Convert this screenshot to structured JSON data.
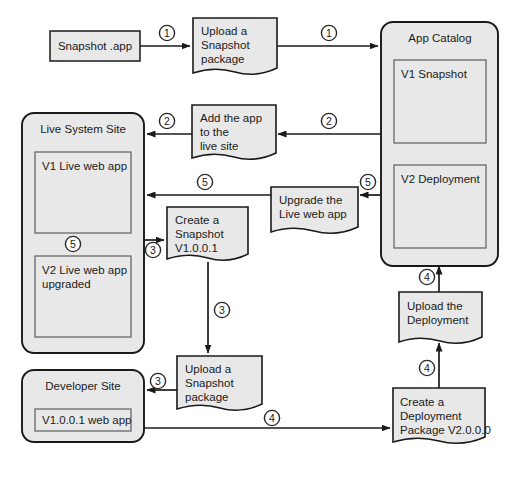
{
  "diagram": {
    "colors": {
      "shape_fill": "#e8e8e8",
      "shape_stroke": "#1a1a1a",
      "inner_stroke": "#5d5d5d",
      "connector": "#1a1a1a",
      "background": "#ffffff"
    },
    "containers": [
      {
        "id": "live-system-site",
        "title": "Live System Site",
        "children": [
          {
            "id": "v1-live-web-app",
            "label": "V1 Live web app"
          },
          {
            "id": "v2-live-web-app",
            "label": "V2 Live web app upgraded",
            "line1": "V2 Live web app",
            "line2": "upgraded"
          }
        ]
      },
      {
        "id": "app-catalog",
        "title": "App Catalog",
        "children": [
          {
            "id": "v1-snapshot",
            "label": "V1 Snapshot"
          },
          {
            "id": "v2-deployment",
            "label": "V2 Deployment"
          }
        ]
      },
      {
        "id": "developer-site",
        "title": "Developer Site",
        "children": [
          {
            "id": "v1001-web-app",
            "label": "V1.0.0.1 web app"
          }
        ]
      }
    ],
    "nodes": [
      {
        "id": "snapshot-app",
        "shape": "rectangle",
        "lines": [
          "Snapshot .app"
        ]
      },
      {
        "id": "upload-snapshot-package-top",
        "shape": "document",
        "lines": [
          "Upload a",
          "Snapshot",
          "package"
        ]
      },
      {
        "id": "add-app-to-live-site",
        "shape": "document",
        "lines": [
          "Add the app",
          "to the",
          "live site"
        ]
      },
      {
        "id": "create-snapshot-v1001",
        "shape": "document",
        "lines": [
          "Create a",
          "Snapshot",
          "V1.0.0.1"
        ]
      },
      {
        "id": "upgrade-live-web-app",
        "shape": "document",
        "lines": [
          "Upgrade the",
          "Live web app"
        ]
      },
      {
        "id": "upload-snapshot-package-bottom",
        "shape": "document",
        "lines": [
          "Upload a",
          "Snapshot",
          "package"
        ]
      },
      {
        "id": "upload-the-deployment",
        "shape": "document",
        "lines": [
          "Upload the",
          "Deployment"
        ]
      },
      {
        "id": "create-deployment-package-v2000",
        "shape": "document",
        "lines": [
          "Create a",
          "Deployment",
          "Package V2.0.0.0"
        ]
      }
    ],
    "step_badges": [
      {
        "id": "badge-1-a",
        "label": "①",
        "number": 1,
        "x": 167,
        "y": 33
      },
      {
        "id": "badge-1-b",
        "label": "①",
        "number": 1,
        "x": 329,
        "y": 33
      },
      {
        "id": "badge-2-a",
        "label": "②",
        "number": 2,
        "x": 167,
        "y": 121
      },
      {
        "id": "badge-2-b",
        "label": "②",
        "number": 2,
        "x": 329,
        "y": 121
      },
      {
        "id": "badge-5-a",
        "label": "⑤",
        "number": 5,
        "x": 205,
        "y": 182
      },
      {
        "id": "badge-5-b",
        "label": "⑤",
        "number": 5,
        "x": 368,
        "y": 182
      },
      {
        "id": "badge-5-c",
        "label": "⑤",
        "number": 5,
        "x": 73,
        "y": 244
      },
      {
        "id": "badge-3-a",
        "label": "③",
        "number": 3,
        "x": 153,
        "y": 250
      },
      {
        "id": "badge-3-b",
        "label": "③",
        "number": 3,
        "x": 222,
        "y": 310
      },
      {
        "id": "badge-3-c",
        "label": "③",
        "number": 3,
        "x": 158,
        "y": 381
      },
      {
        "id": "badge-4-a",
        "label": "④",
        "number": 4,
        "x": 427,
        "y": 277
      },
      {
        "id": "badge-4-b",
        "label": "④",
        "number": 4,
        "x": 427,
        "y": 368
      },
      {
        "id": "badge-4-c",
        "label": "④",
        "number": 4,
        "x": 272,
        "y": 418
      }
    ],
    "connectors": [
      {
        "id": "conn-snapshot-app-to-upload",
        "from": "snapshot-app",
        "to": "upload-snapshot-package-top",
        "step": 1
      },
      {
        "id": "conn-upload-to-app-catalog",
        "from": "upload-snapshot-package-top",
        "to": "app-catalog",
        "step": 1
      },
      {
        "id": "conn-app-catalog-to-add-app",
        "from": "app-catalog",
        "to": "add-app-to-live-site",
        "step": 2
      },
      {
        "id": "conn-add-app-to-live-site",
        "from": "add-app-to-live-site",
        "to": "live-system-site",
        "step": 2
      },
      {
        "id": "conn-v2-deployment-to-upgrade",
        "from": "v2-deployment",
        "to": "upgrade-live-web-app",
        "step": 5
      },
      {
        "id": "conn-upgrade-to-live-system-site",
        "from": "upgrade-live-web-app",
        "to": "live-system-site",
        "step": 5
      },
      {
        "id": "conn-v1-live-to-v2-live",
        "from": "v1-live-web-app",
        "to": "v2-live-web-app",
        "step": 5
      },
      {
        "id": "conn-live-site-to-create-snapshot",
        "from": "live-system-site",
        "to": "create-snapshot-v1001",
        "step": 3
      },
      {
        "id": "conn-create-snapshot-to-upload",
        "from": "create-snapshot-v1001",
        "to": "upload-snapshot-package-bottom",
        "step": 3
      },
      {
        "id": "conn-upload-to-developer-site",
        "from": "upload-snapshot-package-bottom",
        "to": "developer-site",
        "step": 3
      },
      {
        "id": "conn-developer-site-to-create-deployment",
        "from": "developer-site",
        "to": "create-deployment-package-v2000",
        "step": 4
      },
      {
        "id": "conn-create-deployment-to-upload",
        "from": "create-deployment-package-v2000",
        "to": "upload-the-deployment",
        "step": 4
      },
      {
        "id": "conn-upload-deployment-to-app-catalog",
        "from": "upload-the-deployment",
        "to": "app-catalog",
        "step": 4
      }
    ]
  }
}
